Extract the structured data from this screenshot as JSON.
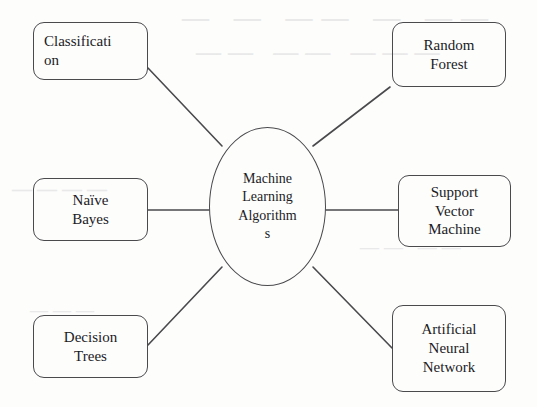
{
  "diagram": {
    "center": {
      "label": "Machine Learning Algorithms",
      "lines": [
        "Machine",
        "Learning",
        "Algorithm",
        "s"
      ]
    },
    "nodes": [
      {
        "id": "classification",
        "label": "Classification",
        "lines": [
          "Classificati",
          "on"
        ]
      },
      {
        "id": "random-forest",
        "label": "Random Forest",
        "lines": [
          "Random",
          "Forest"
        ]
      },
      {
        "id": "naive-bayes",
        "label": "Naïve Bayes",
        "lines": [
          "Naïve",
          "Bayes"
        ]
      },
      {
        "id": "svm",
        "label": "Support Vector Machine",
        "lines": [
          "Support",
          "Vector",
          "Machine"
        ]
      },
      {
        "id": "decision-trees",
        "label": "Decision Trees",
        "lines": [
          "Decision",
          "Trees"
        ]
      },
      {
        "id": "ann",
        "label": "Artificial Neural Network",
        "lines": [
          "Artificial",
          "Neural",
          "Network"
        ]
      }
    ],
    "colors": {
      "stroke": "#4a4a4d",
      "text": "#1b1b1e",
      "background": "#fdfdfc",
      "ghost": "#e9e9ea"
    },
    "ghost_marks": {
      "a": "— —  ——  — ——",
      "b": "—— —— ———",
      "c": "————",
      "d": "—— ——",
      "e": "———"
    }
  }
}
